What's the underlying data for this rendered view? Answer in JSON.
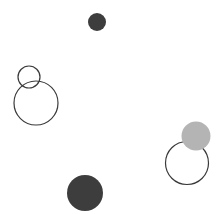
{
  "canvas": {
    "width": 223,
    "height": 214,
    "background": "#ffffff"
  },
  "colors": {
    "dark": "#3d3d3d",
    "gray": "#b4b4b4",
    "stroke": "#3a3a3a"
  },
  "shapes": [
    {
      "id": "dark-small",
      "type": "filled",
      "cx": 97,
      "cy": 22,
      "r": 9,
      "fill": "#3d3d3d"
    },
    {
      "id": "ring-small",
      "type": "outline",
      "cx": 29,
      "cy": 77,
      "r": 11,
      "stroke": "#3a3a3a"
    },
    {
      "id": "ring-large-left",
      "type": "outline",
      "cx": 36,
      "cy": 103,
      "r": 22,
      "stroke": "#3a3a3a"
    },
    {
      "id": "ring-right",
      "type": "outline",
      "cx": 187,
      "cy": 163,
      "r": 21.5,
      "stroke": "#3a3a3a"
    },
    {
      "id": "gray-filled",
      "type": "filled",
      "cx": 196,
      "cy": 136,
      "r": 14.5,
      "fill": "#b4b4b4"
    },
    {
      "id": "dark-large",
      "type": "filled",
      "cx": 85,
      "cy": 193,
      "r": 18,
      "fill": "#3d3d3d"
    }
  ]
}
